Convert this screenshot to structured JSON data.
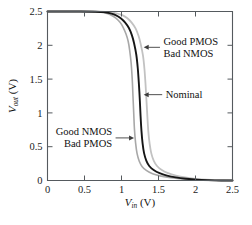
{
  "chart_data": {
    "type": "line",
    "title": "",
    "xlabel": "V_in (V)",
    "ylabel": "V_out (V)",
    "xlim": [
      0,
      2.5
    ],
    "ylim": [
      0,
      2.5
    ],
    "xticks": [
      "0",
      "0.5",
      "1",
      "1.5",
      "2",
      "2.5"
    ],
    "xtick_values": [
      0,
      0.5,
      1,
      1.5,
      2,
      2.5
    ],
    "yticks": [
      "0",
      "0.5",
      "1",
      "1.5",
      "2",
      "2.5"
    ],
    "ytick_values": [
      0,
      0.5,
      1,
      1.5,
      2,
      2.5
    ],
    "grid": false,
    "legend": "none (inline annotations with arrows)",
    "series": [
      {
        "name": "Good NMOS Bad PMOS",
        "color": "#a8a8a8",
        "width": 1.6,
        "points": [
          [
            0.0,
            2.5
          ],
          [
            0.4,
            2.5
          ],
          [
            0.6,
            2.498
          ],
          [
            0.7,
            2.492
          ],
          [
            0.78,
            2.478
          ],
          [
            0.85,
            2.452
          ],
          [
            0.92,
            2.405
          ],
          [
            0.98,
            2.34
          ],
          [
            1.02,
            2.27
          ],
          [
            1.06,
            2.17
          ],
          [
            1.09,
            2.06
          ],
          [
            1.11,
            1.93
          ],
          [
            1.13,
            1.74
          ],
          [
            1.145,
            1.5
          ],
          [
            1.155,
            1.25
          ],
          [
            1.165,
            1.0
          ],
          [
            1.175,
            0.76
          ],
          [
            1.19,
            0.56
          ],
          [
            1.21,
            0.4
          ],
          [
            1.24,
            0.285
          ],
          [
            1.28,
            0.205
          ],
          [
            1.34,
            0.145
          ],
          [
            1.42,
            0.1
          ],
          [
            1.52,
            0.068
          ],
          [
            1.64,
            0.044
          ],
          [
            1.78,
            0.026
          ],
          [
            1.92,
            0.013
          ],
          [
            2.1,
            0.005
          ],
          [
            2.3,
            0.002
          ],
          [
            2.5,
            0.0
          ]
        ]
      },
      {
        "name": "Nominal",
        "color": "#161616",
        "width": 1.9,
        "points": [
          [
            0.0,
            2.5
          ],
          [
            0.45,
            2.5
          ],
          [
            0.65,
            2.497
          ],
          [
            0.76,
            2.49
          ],
          [
            0.84,
            2.475
          ],
          [
            0.92,
            2.448
          ],
          [
            0.99,
            2.4
          ],
          [
            1.05,
            2.335
          ],
          [
            1.1,
            2.255
          ],
          [
            1.14,
            2.15
          ],
          [
            1.17,
            2.03
          ],
          [
            1.2,
            1.86
          ],
          [
            1.22,
            1.66
          ],
          [
            1.235,
            1.43
          ],
          [
            1.248,
            1.18
          ],
          [
            1.258,
            0.95
          ],
          [
            1.27,
            0.73
          ],
          [
            1.285,
            0.55
          ],
          [
            1.305,
            0.405
          ],
          [
            1.335,
            0.295
          ],
          [
            1.375,
            0.215
          ],
          [
            1.435,
            0.155
          ],
          [
            1.515,
            0.108
          ],
          [
            1.615,
            0.073
          ],
          [
            1.735,
            0.046
          ],
          [
            1.875,
            0.026
          ],
          [
            2.02,
            0.012
          ],
          [
            2.18,
            0.005
          ],
          [
            2.35,
            0.001
          ],
          [
            2.5,
            0.0
          ]
        ]
      },
      {
        "name": "Good PMOS Bad NMOS",
        "color": "#c2c2c2",
        "width": 1.8,
        "points": [
          [
            0.0,
            2.5
          ],
          [
            0.5,
            2.5
          ],
          [
            0.72,
            2.497
          ],
          [
            0.84,
            2.489
          ],
          [
            0.93,
            2.474
          ],
          [
            1.01,
            2.446
          ],
          [
            1.08,
            2.4
          ],
          [
            1.14,
            2.332
          ],
          [
            1.19,
            2.25
          ],
          [
            1.23,
            2.14
          ],
          [
            1.26,
            2.015
          ],
          [
            1.29,
            1.85
          ],
          [
            1.31,
            1.65
          ],
          [
            1.325,
            1.42
          ],
          [
            1.338,
            1.17
          ],
          [
            1.35,
            0.94
          ],
          [
            1.363,
            0.72
          ],
          [
            1.38,
            0.545
          ],
          [
            1.402,
            0.405
          ],
          [
            1.435,
            0.295
          ],
          [
            1.48,
            0.215
          ],
          [
            1.545,
            0.155
          ],
          [
            1.63,
            0.108
          ],
          [
            1.735,
            0.073
          ],
          [
            1.86,
            0.045
          ],
          [
            2.0,
            0.025
          ],
          [
            2.15,
            0.011
          ],
          [
            2.3,
            0.004
          ],
          [
            2.42,
            0.001
          ],
          [
            2.5,
            0.0
          ]
        ]
      }
    ],
    "annotations": [
      {
        "id": "good-pmos-bad-nmos",
        "line1": "Good PMOS",
        "line2": "Bad NMOS",
        "arrow_from_x": 1.52,
        "arrow_from_y": 1.97,
        "arrow_to_x": 1.3,
        "arrow_to_y": 1.97
      },
      {
        "id": "nominal",
        "line1": "Nominal",
        "line2": "",
        "arrow_from_x": 1.55,
        "arrow_from_y": 1.27,
        "arrow_to_x": 1.3,
        "arrow_to_y": 1.27
      },
      {
        "id": "good-nmos-bad-pmos",
        "line1": "Good NMOS",
        "line2": "Bad PMOS",
        "arrow_from_x": 0.92,
        "arrow_from_y": 0.63,
        "arrow_to_x": 1.17,
        "arrow_to_y": 0.63
      }
    ]
  },
  "axis": {
    "x_symbol": "V",
    "x_sub": "in",
    "x_unit": "(V)",
    "y_symbol": "V",
    "y_sub": "out",
    "y_unit": "(V)"
  }
}
